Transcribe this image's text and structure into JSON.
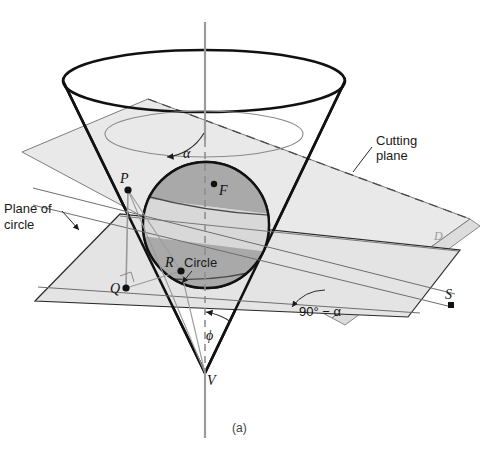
{
  "figure": {
    "caption": "(a)",
    "colors": {
      "cutting_plane_fill": "#e8e8e8",
      "circle_plane_fill": "#e4e4e4",
      "sphere_light": "#d0d0d0",
      "sphere_band": "#a8a8a8",
      "outline_dark": "#111111",
      "outline_thin": "#6e6e6e",
      "axis_gray": "#9b9b9b",
      "background": "#ffffff"
    },
    "labels": {
      "cutting_plane": "Cutting\nplane",
      "cutting_plane_line1": "Cutting",
      "cutting_plane_line2": "plane",
      "plane_of_circle_line1": "Plane of",
      "plane_of_circle_line2": "circle",
      "circle": "Circle",
      "point_P": "P",
      "point_Q": "Q",
      "point_R": "R",
      "point_F": "F",
      "point_S": "S",
      "point_V": "V",
      "point_D": "D",
      "angle_alpha": "α",
      "angle_phi": "ϕ",
      "angle_ninety_minus_alpha": "90° − α"
    }
  }
}
